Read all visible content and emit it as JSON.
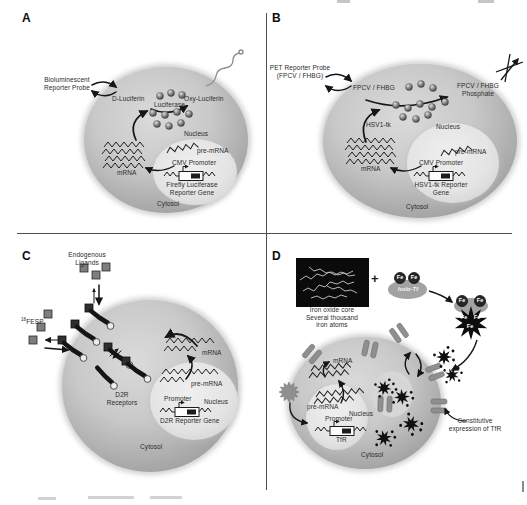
{
  "figure": {
    "panel_a": {
      "label": "A",
      "probe_line1": "Bioluminescent",
      "probe_line2": "Reporter Probe",
      "substrate": "D-Luciferin",
      "enzyme": "Luciferase",
      "product": "Oxy-Luciferin",
      "nucleus": "Nucleus",
      "pre_mrna": "pre-mRNA",
      "promoter": "CMV Promoter",
      "gene_line1": "Firefly Luciferase",
      "gene_line2": "Reporter Gene",
      "mrna": "mRNA",
      "cytosol": "Cytosol"
    },
    "panel_b": {
      "label": "B",
      "probe_line1": "PET Reporter Probe",
      "probe_line2": "(FPCV / FHBG)",
      "substrate": "FPCV / FHBG",
      "product_line1": "FPCV / FHBG",
      "product_line2": "Phosphate",
      "enzyme": "HSV1-tk",
      "nucleus": "Nucleus",
      "pre_mrna": "pre-mRNA",
      "promoter": "CMV Promoter",
      "gene_line1": "HSV1-tk Reporter",
      "gene_line2": "Gene",
      "mrna": "mRNA",
      "cytosol": "Cytosol"
    },
    "panel_c": {
      "label": "C",
      "ligands_line1": "Endogenous",
      "ligands_line2": "Ligands",
      "tracer_sup": "18",
      "tracer": "FESP",
      "receptor_line1": "D2R",
      "receptor_line2": "Receptors",
      "mrna": "mRNA",
      "pre_mrna": "pre-mRNA",
      "promoter": "Promoter",
      "nucleus": "Nucleus",
      "gene": "D2R Reporter Gene",
      "cytosol": "Cytosol"
    },
    "panel_d": {
      "label": "D",
      "core_line1": "Iron oxide core",
      "core_line2": "Several thousand",
      "core_line3": "iron atoms",
      "plus": "+",
      "fe": "Fe",
      "holo_tf": "holo-Tf",
      "mrna": "mRNA",
      "pre_mrna": "pre-mRNA",
      "nucleus": "Nucleus",
      "promoter": "Promoter",
      "tfr": "TfR",
      "cytosol": "Cytosol",
      "constitutive_line1": "Constitutive",
      "constitutive_line2": "expression of TfR"
    }
  },
  "colors": {
    "background": "#ffffff",
    "cell_edge": "#979797",
    "cell_center": "#d9d9d9",
    "nucleus": "#ececec",
    "line": "#1a1a1a",
    "receptor_dark": "#141414",
    "tfr_bar": "#8f8f8f",
    "iron_box": "#0b0b0b",
    "fe_circle": "#272727"
  }
}
